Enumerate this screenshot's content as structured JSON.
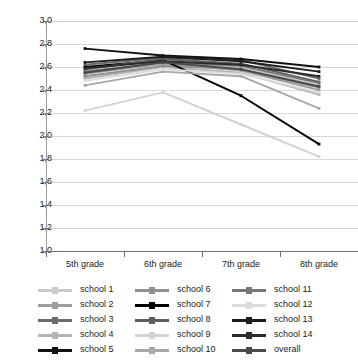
{
  "chart_data": {
    "type": "line",
    "title": "",
    "xlabel": "",
    "ylabel": "",
    "categories": [
      "5th grade",
      "6th grade",
      "7th grade",
      "8th grade"
    ],
    "ylim": [
      1.0,
      3.0
    ],
    "ytick_step": 0.2,
    "decimal_separator": ",",
    "grid": true,
    "legend_position": "bottom",
    "legend_columns": 3,
    "yticks": [
      "3,0",
      "2,8",
      "2,6",
      "2,4",
      "2,2",
      "2,0",
      "1,8",
      "1,6",
      "1,4",
      "1,2",
      "1,0"
    ],
    "series": [
      {
        "name": "school 1",
        "color": "#c9c9c9",
        "values": [
          2.57,
          2.62,
          2.6,
          2.44
        ]
      },
      {
        "name": "school 2",
        "color": "#9e9e9e",
        "values": [
          2.54,
          2.63,
          2.57,
          2.4
        ]
      },
      {
        "name": "school 3",
        "color": "#6b6b6b",
        "values": [
          2.62,
          2.68,
          2.66,
          2.5
        ]
      },
      {
        "name": "school 4",
        "color": "#b5b5b5",
        "values": [
          2.5,
          2.6,
          2.55,
          2.36
        ]
      },
      {
        "name": "school 5",
        "color": "#111111",
        "values": [
          2.76,
          2.7,
          2.67,
          2.6
        ]
      },
      {
        "name": "school 6",
        "color": "#8f8f8f",
        "values": [
          2.52,
          2.61,
          2.58,
          2.42
        ]
      },
      {
        "name": "school 7",
        "color": "#000000",
        "values": [
          2.6,
          2.66,
          2.35,
          1.93
        ]
      },
      {
        "name": "school 8",
        "color": "#5e5e5e",
        "values": [
          2.58,
          2.67,
          2.63,
          2.47
        ]
      },
      {
        "name": "school 9",
        "color": "#d2d2d2",
        "values": [
          2.22,
          2.38,
          2.1,
          1.82
        ]
      },
      {
        "name": "school 10",
        "color": "#a8a8a8",
        "values": [
          2.44,
          2.56,
          2.52,
          2.24
        ]
      },
      {
        "name": "school 11",
        "color": "#777777",
        "values": [
          2.56,
          2.64,
          2.61,
          2.46
        ]
      },
      {
        "name": "school 12",
        "color": "#dcdcdc",
        "values": [
          2.48,
          2.58,
          2.54,
          2.38
        ]
      },
      {
        "name": "school 13",
        "color": "#1c1c1c",
        "values": [
          2.64,
          2.69,
          2.65,
          2.56
        ]
      },
      {
        "name": "school 14",
        "color": "#2b2b2b",
        "values": [
          2.59,
          2.65,
          2.62,
          2.52
        ]
      },
      {
        "name": "overall",
        "color": "#4a4a4a",
        "values": [
          2.55,
          2.64,
          2.58,
          2.43
        ]
      }
    ]
  },
  "legend": {
    "columns": [
      {
        "items": [
          "school 1",
          "school 2",
          "school 3",
          "school 4",
          "school 5"
        ]
      },
      {
        "items": [
          "school 6",
          "school 7",
          "school 8",
          "school 9",
          "school 10"
        ]
      },
      {
        "items": [
          "school 11",
          "school 12",
          "school 13",
          "school 14",
          "overall"
        ]
      }
    ]
  }
}
